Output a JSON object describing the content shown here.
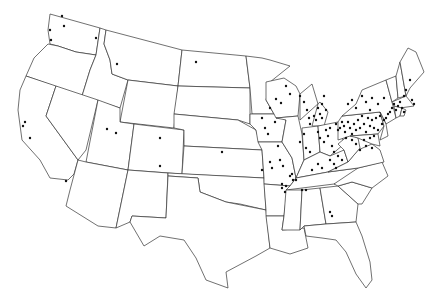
{
  "map": {
    "type": "choropleth-outline-with-points",
    "region": "Contiguous United States",
    "colors": {
      "background": "#ffffff",
      "border": "#333333",
      "point": "#111111"
    },
    "states": [
      {
        "name": "WA",
        "d": "M50,14 L100,28 L96,55 L76,52 L58,46 L50,44 L48,30 Z"
      },
      {
        "name": "OR",
        "d": "M48,44 L58,46 L76,52 L96,55 L90,70 L82,96 L26,76 L34,58 Z"
      },
      {
        "name": "CA",
        "d": "M26,76 L56,86 L46,116 L78,160 L74,174 L68,180 L50,178 L40,160 L22,140 L18,110 L20,90 Z"
      },
      {
        "name": "ID",
        "d": "M100,28 L106,30 L104,44 L110,60 L112,74 L128,80 L120,108 L82,96 L90,70 L96,55 Z"
      },
      {
        "name": "NV",
        "d": "M56,86 L98,100 L86,150 L78,160 L46,116 Z"
      },
      {
        "name": "MT",
        "d": "M106,30 L182,50 L178,86 L128,80 L112,74 L110,60 L104,44 Z"
      },
      {
        "name": "WY",
        "d": "M128,80 L178,86 L174,128 L120,122 Z"
      },
      {
        "name": "UT",
        "d": "M98,100 L120,108 L120,122 L134,124 L128,170 L86,162 Z"
      },
      {
        "name": "AZ",
        "d": "M86,162 L128,170 L116,228 L98,226 L66,206 L70,190 L78,160 Z"
      },
      {
        "name": "CO",
        "d": "M134,124 L184,130 L182,174 L128,170 Z"
      },
      {
        "name": "NM",
        "d": "M128,170 L168,173 L166,218 L132,216 L130,222 L116,228 Z"
      },
      {
        "name": "ND",
        "d": "M182,50 L246,56 L250,88 L178,86 Z"
      },
      {
        "name": "SD",
        "d": "M178,86 L250,88 L250,124 L238,120 L174,114 Z"
      },
      {
        "name": "NE",
        "d": "M174,114 L238,120 L256,130 L262,150 L184,146 L184,130 L174,128 Z"
      },
      {
        "name": "KS",
        "d": "M184,146 L262,150 L264,178 L182,174 Z"
      },
      {
        "name": "OK",
        "d": "M168,173 L264,178 L266,210 L240,204 L226,202 L200,192 L198,178 L168,176 Z"
      },
      {
        "name": "TX",
        "d": "M168,176 L198,178 L200,192 L226,202 L266,210 L270,248 L256,256 L226,272 L228,288 L206,280 L196,258 L184,240 L160,236 L144,246 L130,222 L132,216 L166,218 Z"
      },
      {
        "name": "MN",
        "d": "M246,56 L262,58 L270,60 L290,66 L270,82 L266,100 L274,114 L252,114 L250,88 Z"
      },
      {
        "name": "IA",
        "d": "M250,114 L274,114 L286,120 L282,142 L258,142 L256,130 L250,124 Z"
      },
      {
        "name": "MO",
        "d": "M258,142 L282,142 L292,158 L296,178 L290,186 L264,184 L264,178 L262,150 Z"
      },
      {
        "name": "AR",
        "d": "M264,184 L290,186 L286,200 L284,216 L266,216 L266,210 Z"
      },
      {
        "name": "LA",
        "d": "M266,216 L284,216 L282,230 L304,228 L308,248 L290,254 L270,248 Z"
      },
      {
        "name": "WI",
        "d": "M266,82 L284,78 L296,86 L300,94 L298,116 L276,118 L274,114 L266,100 Z"
      },
      {
        "name": "IL",
        "d": "M276,118 L298,116 L302,134 L304,160 L296,178 L292,158 L282,142 L286,120 Z"
      },
      {
        "name": "MI",
        "d": "M300,94 L312,84 L318,104 L312,126 L324,126 L328,112 L320,102 L300,120 Z"
      },
      {
        "name": "IN",
        "d": "M302,128 L318,126 L320,152 L304,160 Z"
      },
      {
        "name": "OH",
        "d": "M318,126 L338,122 L344,144 L330,156 L320,152 Z"
      },
      {
        "name": "KY",
        "d": "M296,178 L304,160 L320,152 L330,156 L344,150 L348,162 L328,172 L296,178 Z"
      },
      {
        "name": "TN",
        "d": "M290,186 L296,178 L328,172 L358,168 L346,180 L334,184 L286,190 Z"
      },
      {
        "name": "MS",
        "d": "M286,190 L302,190 L300,230 L282,230 L284,216 Z"
      },
      {
        "name": "AL",
        "d": "M302,190 L320,188 L326,224 L304,226 L300,230 Z"
      },
      {
        "name": "GA",
        "d": "M320,188 L338,186 L358,204 L356,222 L326,224 Z"
      },
      {
        "name": "FL",
        "d": "M304,226 L326,224 L356,222 L362,236 L370,262 L372,280 L366,288 L356,274 L346,252 L336,240 L322,238 L306,236 Z"
      },
      {
        "name": "SC",
        "d": "M338,186 L352,182 L372,188 L362,204 L358,204 Z"
      },
      {
        "name": "NC",
        "d": "M334,184 L358,168 L382,162 L388,176 L372,188 L352,182 L338,186 Z"
      },
      {
        "name": "VA",
        "d": "M328,172 L348,162 L358,150 L372,144 L380,150 L384,162 L358,168 Z"
      },
      {
        "name": "WV",
        "d": "M338,144 L350,134 L358,138 L360,148 L348,162 L344,150 Z"
      },
      {
        "name": "PA",
        "d": "M338,122 L342,116 L380,112 L384,126 L378,134 L350,136 L338,140 Z"
      },
      {
        "name": "NY",
        "d": "M342,116 L356,104 L362,90 L386,80 L392,102 L396,118 L386,124 L380,112 Z"
      },
      {
        "name": "MD",
        "d": "M350,136 L378,134 L380,146 L372,144 L358,138 Z"
      },
      {
        "name": "NJ",
        "d": "M380,112 L386,124 L388,136 L380,140 L384,126 Z"
      },
      {
        "name": "VT",
        "d": "M386,80 L396,76 L398,98 L392,102 Z"
      },
      {
        "name": "NH",
        "d": "M396,76 L400,62 L406,96 L398,98 Z"
      },
      {
        "name": "ME",
        "d": "M400,62 L408,48 L416,52 L424,72 L410,88 L406,96 Z"
      },
      {
        "name": "MA",
        "d": "M392,102 L406,96 L414,106 L400,108 L394,106 Z"
      },
      {
        "name": "CT",
        "d": "M394,106 L402,108 L400,116 L396,118 Z"
      },
      {
        "name": "RI",
        "d": "M402,108 L406,110 L404,116 L400,116 Z"
      }
    ],
    "points": [
      [
        62,
        16
      ],
      [
        64,
        26
      ],
      [
        50,
        30
      ],
      [
        51,
        40
      ],
      [
        96,
        38
      ],
      [
        117,
        64
      ],
      [
        196,
        62
      ],
      [
        222,
        152
      ],
      [
        107,
        129
      ],
      [
        116,
        133
      ],
      [
        160,
        138
      ],
      [
        160,
        166
      ],
      [
        30,
        138
      ],
      [
        66,
        181
      ],
      [
        25,
        122
      ],
      [
        23,
        126
      ],
      [
        270,
        108
      ],
      [
        262,
        118
      ],
      [
        265,
        128
      ],
      [
        268,
        134
      ],
      [
        276,
        99
      ],
      [
        281,
        103
      ],
      [
        286,
        86
      ],
      [
        290,
        94
      ],
      [
        275,
        122
      ],
      [
        278,
        146
      ],
      [
        280,
        160
      ],
      [
        283,
        166
      ],
      [
        292,
        174
      ],
      [
        296,
        180
      ],
      [
        300,
        96
      ],
      [
        304,
        102
      ],
      [
        307,
        110
      ],
      [
        309,
        118
      ],
      [
        310,
        124
      ],
      [
        314,
        116
      ],
      [
        316,
        120
      ],
      [
        318,
        108
      ],
      [
        320,
        114
      ],
      [
        322,
        118
      ],
      [
        322,
        104
      ],
      [
        326,
        110
      ],
      [
        324,
        96
      ],
      [
        304,
        134
      ],
      [
        300,
        142
      ],
      [
        306,
        148
      ],
      [
        310,
        152
      ],
      [
        318,
        132
      ],
      [
        320,
        138
      ],
      [
        324,
        142
      ],
      [
        326,
        130
      ],
      [
        328,
        136
      ],
      [
        330,
        128
      ],
      [
        332,
        146
      ],
      [
        334,
        152
      ],
      [
        336,
        124
      ],
      [
        338,
        130
      ],
      [
        340,
        128
      ],
      [
        342,
        122
      ],
      [
        344,
        126
      ],
      [
        345,
        132
      ],
      [
        346,
        138
      ],
      [
        348,
        122
      ],
      [
        350,
        128
      ],
      [
        352,
        134
      ],
      [
        354,
        124
      ],
      [
        356,
        130
      ],
      [
        358,
        120
      ],
      [
        360,
        128
      ],
      [
        362,
        116
      ],
      [
        364,
        124
      ],
      [
        366,
        132
      ],
      [
        368,
        118
      ],
      [
        370,
        126
      ],
      [
        372,
        120
      ],
      [
        374,
        128
      ],
      [
        376,
        118
      ],
      [
        378,
        130
      ],
      [
        380,
        116
      ],
      [
        382,
        124
      ],
      [
        384,
        120
      ],
      [
        386,
        118
      ],
      [
        388,
        114
      ],
      [
        390,
        112
      ],
      [
        392,
        108
      ],
      [
        394,
        104
      ],
      [
        396,
        110
      ],
      [
        398,
        106
      ],
      [
        400,
        102
      ],
      [
        402,
        108
      ],
      [
        404,
        112
      ],
      [
        352,
        140
      ],
      [
        356,
        144
      ],
      [
        360,
        150
      ],
      [
        364,
        140
      ],
      [
        366,
        146
      ],
      [
        370,
        138
      ],
      [
        372,
        148
      ],
      [
        374,
        136
      ],
      [
        338,
        156
      ],
      [
        342,
        160
      ],
      [
        330,
        160
      ],
      [
        334,
        164
      ],
      [
        312,
        170
      ],
      [
        318,
        164
      ],
      [
        322,
        168
      ],
      [
        336,
        168
      ],
      [
        290,
        176
      ],
      [
        293,
        180
      ],
      [
        282,
        184
      ],
      [
        286,
        186
      ],
      [
        302,
        190
      ],
      [
        306,
        190
      ],
      [
        282,
        188
      ],
      [
        285,
        192
      ],
      [
        270,
        162
      ],
      [
        272,
        168
      ],
      [
        330,
        212
      ],
      [
        332,
        216
      ],
      [
        262,
        170
      ],
      [
        348,
        104
      ],
      [
        352,
        100
      ],
      [
        356,
        108
      ],
      [
        362,
        96
      ],
      [
        366,
        102
      ],
      [
        370,
        110
      ],
      [
        372,
        98
      ],
      [
        378,
        104
      ],
      [
        384,
        98
      ],
      [
        410,
        80
      ],
      [
        406,
        90
      ],
      [
        404,
        96
      ],
      [
        412,
        100
      ],
      [
        414,
        104
      ]
    ]
  }
}
